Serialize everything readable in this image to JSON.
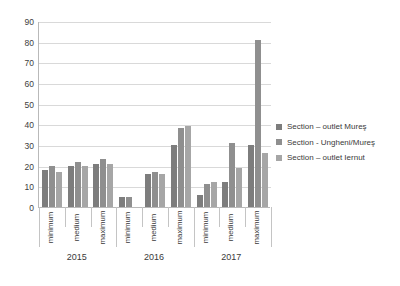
{
  "chart_data": {
    "type": "bar",
    "title": "",
    "xlabel": "",
    "ylabel": "",
    "ylim": [
      0,
      90
    ],
    "yticks": [
      0,
      10,
      20,
      30,
      40,
      50,
      60,
      70,
      80,
      90
    ],
    "grid": true,
    "legend_position": "right",
    "categories": [
      "minimum",
      "medium",
      "maximum",
      "minimum",
      "medium",
      "maximum",
      "minimum",
      "medium",
      "maximum"
    ],
    "groups": [
      "2015",
      "2016",
      "2017"
    ],
    "series": [
      {
        "name": "Section – outlet Mureş",
        "color": "#7d7d7d",
        "values": [
          18,
          20,
          21,
          5,
          16,
          30,
          6,
          12,
          30
        ]
      },
      {
        "name": "Section - Ungheni/Mureş",
        "color": "#8f8f8f",
        "values": [
          20,
          22,
          23,
          5,
          17,
          38,
          11,
          31,
          81
        ]
      },
      {
        "name": "Section – outlet Iernut",
        "color": "#a6a6a6",
        "values": [
          17,
          20,
          21,
          0,
          16,
          39,
          12,
          19,
          26
        ]
      }
    ]
  },
  "legend": {
    "items": [
      {
        "label": "Section – outlet Mureş",
        "color": "#7d7d7d"
      },
      {
        "label": "Section - Ungheni/Mureş",
        "color": "#8f8f8f"
      },
      {
        "label": "Section – outlet Iernut",
        "color": "#a6a6a6"
      }
    ]
  },
  "axis": {
    "y_ticks": [
      "0",
      "10",
      "20",
      "30",
      "40",
      "50",
      "60",
      "70",
      "80",
      "90"
    ]
  }
}
